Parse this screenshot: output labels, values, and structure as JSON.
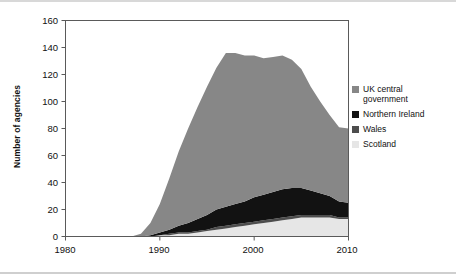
{
  "chart_data": {
    "type": "area",
    "stacked": true,
    "title": "",
    "subtitle": "",
    "xlabel": "",
    "ylabel": "Number of agencies",
    "xlim": [
      1980,
      2010
    ],
    "ylim": [
      0,
      160
    ],
    "xticks": [
      1980,
      1990,
      2000,
      2010
    ],
    "yticks": [
      0,
      20,
      40,
      60,
      80,
      100,
      120,
      140,
      160
    ],
    "grid": false,
    "legend_position": "right",
    "x": [
      1980,
      1981,
      1982,
      1983,
      1984,
      1985,
      1986,
      1987,
      1988,
      1989,
      1990,
      1991,
      1992,
      1993,
      1994,
      1995,
      1996,
      1997,
      1998,
      1999,
      2000,
      2001,
      2002,
      2003,
      2004,
      2005,
      2006,
      2007,
      2008,
      2009,
      2010
    ],
    "series": [
      {
        "name": "Scotland",
        "color": "#e6e6e6",
        "values": [
          0,
          0,
          0,
          0,
          0,
          0,
          0,
          0,
          0,
          0,
          1,
          1,
          2,
          2,
          3,
          4,
          5,
          6,
          7,
          8,
          9,
          10,
          11,
          12,
          13,
          14,
          14,
          14,
          14,
          13,
          13
        ]
      },
      {
        "name": "Wales",
        "color": "#4d4d4d",
        "values": [
          0,
          0,
          0,
          0,
          0,
          0,
          0,
          0,
          0,
          0,
          0,
          1,
          1,
          1,
          1,
          1,
          2,
          2,
          2,
          2,
          2,
          2,
          2,
          2,
          2,
          2,
          2,
          2,
          2,
          1,
          1
        ]
      },
      {
        "name": "Northern Ireland",
        "color": "#121212",
        "values": [
          0,
          0,
          0,
          0,
          0,
          0,
          0,
          0,
          0,
          1,
          2,
          3,
          5,
          7,
          9,
          11,
          13,
          14,
          15,
          16,
          18,
          19,
          20,
          21,
          21,
          20,
          18,
          16,
          14,
          12,
          11
        ]
      },
      {
        "name": "UK central government",
        "color": "#878787",
        "values": [
          0,
          0,
          0,
          0,
          0,
          0,
          0,
          0,
          2,
          9,
          21,
          38,
          55,
          70,
          83,
          95,
          105,
          114,
          112,
          108,
          105,
          101,
          100,
          99,
          95,
          88,
          77,
          68,
          60,
          55,
          55
        ]
      }
    ],
    "totals": [
      0,
      0,
      0,
      0,
      0,
      0,
      0,
      0,
      2,
      10,
      24,
      43,
      63,
      80,
      96,
      111,
      125,
      136,
      136,
      134,
      134,
      132,
      133,
      134,
      131,
      124,
      111,
      100,
      90,
      81,
      80
    ]
  },
  "legend": {
    "items": [
      {
        "label": "UK central\ngovernment",
        "color": "#878787",
        "name": "uk-central-government"
      },
      {
        "label": "Northern Ireland",
        "color": "#121212",
        "name": "northern-ireland"
      },
      {
        "label": "Wales",
        "color": "#4d4d4d",
        "name": "wales"
      },
      {
        "label": "Scotland",
        "color": "#e6e6e6",
        "name": "scotland"
      }
    ]
  },
  "axes": {
    "y_title": "Number of agencies",
    "y_ticks": [
      "160",
      "140",
      "120",
      "100",
      "80",
      "60",
      "40",
      "20",
      "0"
    ],
    "x_ticks": [
      "1980",
      "1990",
      "2000",
      "2010"
    ]
  }
}
